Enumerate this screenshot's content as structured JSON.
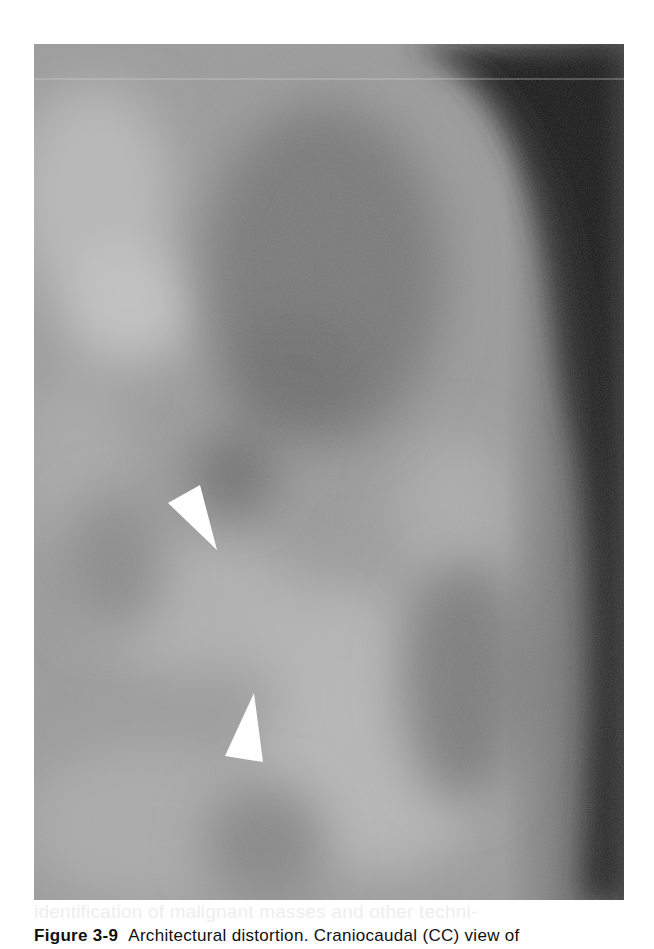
{
  "figure": {
    "type": "mammogram",
    "view": "Craniocaudal (CC)",
    "arrowheads": [
      {
        "id": "arrowhead-1",
        "points": "134,459 166,441 183,506",
        "color": "#ffffff"
      },
      {
        "id": "arrowhead-2",
        "points": "220,649 191,712 229,718",
        "color": "#ffffff"
      }
    ],
    "tones": {
      "background_dark": "#1a1a1a",
      "tissue_light": "#b4b4b4",
      "tissue_mid": "#8a8a8a",
      "tissue_dark": "#6a6a6a"
    }
  },
  "caption": {
    "label": "Figure 3-9",
    "text": "Architectural distortion. Craniocaudal (CC) view of"
  },
  "bleed_through": {
    "text": "identification of malignant masses and other techni-"
  }
}
